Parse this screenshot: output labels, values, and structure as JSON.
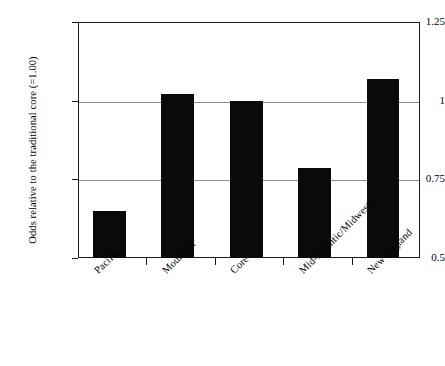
{
  "chart_data": {
    "type": "bar",
    "title": "",
    "xlabel": "",
    "ylabel": "Odds relative to the traditional core (=1.00)",
    "categories": [
      "Pacific",
      "Mountain",
      "Core",
      "Mid-Atlantic/Midwest",
      "New England"
    ],
    "values": [
      0.65,
      1.02,
      1.0,
      0.785,
      1.07
    ],
    "ylim": [
      0.5,
      1.25
    ],
    "yticks": [
      0.5,
      0.75,
      1,
      1.25
    ],
    "ytick_labels": [
      "0.5",
      "0.75",
      "1",
      "1.25"
    ],
    "grid": true,
    "gridlines_at": [
      0.75,
      1
    ],
    "legend": "none",
    "bar_color": "#0a0a0a",
    "gridline_color": "#8c8c8c",
    "axis_color": "#1a1a1a",
    "background_color": "#ffffff",
    "category_label_rotation": -45
  }
}
